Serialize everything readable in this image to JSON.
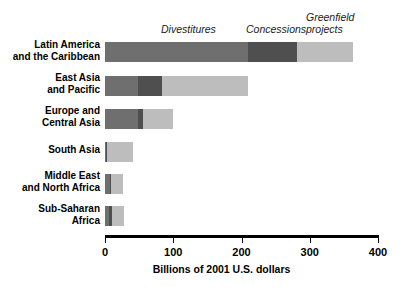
{
  "chart_data": {
    "type": "bar",
    "orientation": "horizontal",
    "stacked": true,
    "title": "",
    "subtitle": "",
    "xlabel": "Billions of 2001 U.S. dollars",
    "ylabel": "",
    "xlim": [
      0,
      400
    ],
    "xticks": [
      0,
      100,
      200,
      300,
      400
    ],
    "xtick_labels": [
      "0",
      "100",
      "200",
      "300",
      "400"
    ],
    "grid": false,
    "legend_position": "top",
    "categories": [
      "Latin America\nand the Caribbean",
      "East Asia\nand Pacific",
      "Europe and\nCentral Asia",
      "South Asia",
      "Middle East\nand North Africa",
      "Sub-Saharan\nAfrica"
    ],
    "series": [
      {
        "name": "Divestitures",
        "color": "#6f6f6f",
        "values": [
          210,
          49,
          48,
          2,
          7,
          6
        ]
      },
      {
        "name": "Concessions",
        "color": "#4f4f4f",
        "values": [
          72,
          35,
          7,
          1,
          2,
          4
        ]
      },
      {
        "name": "Greenfield projects",
        "color": "#bdbdbd",
        "values": [
          81,
          126,
          45,
          38,
          17,
          18
        ]
      }
    ],
    "totals": [
      363,
      210,
      100,
      41,
      26,
      28
    ]
  },
  "legend": {
    "divestitures": "Divestitures",
    "concessions": "Concessions",
    "greenfield": "Greenfield\nprojects"
  },
  "axis": {
    "title": "Billions of 2001 U.S. dollars",
    "ticks": [
      "0",
      "100",
      "200",
      "300",
      "400"
    ]
  },
  "rows": [
    {
      "label": "Latin America\nand the Caribbean"
    },
    {
      "label": "East Asia\nand Pacific"
    },
    {
      "label": "Europe and\nCentral Asia"
    },
    {
      "label": "South Asia"
    },
    {
      "label": "Middle East\nand North Africa"
    },
    {
      "label": "Sub-Saharan\nAfrica"
    }
  ],
  "colors": {
    "divestitures": "#6f6f6f",
    "concessions": "#4f4f4f",
    "greenfield": "#bdbdbd",
    "axis": "#000000",
    "background": "#ffffff"
  }
}
